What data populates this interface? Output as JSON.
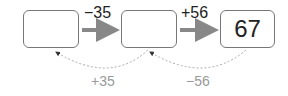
{
  "boxes": [
    {
      "value": ""
    },
    {
      "value": ""
    },
    {
      "value": "67"
    }
  ],
  "forward_ops": [
    "−35",
    "+56"
  ],
  "inverse_ops": [
    "+35",
    "−56"
  ],
  "colors": {
    "arrow": "#888888",
    "box_border": "#777777",
    "inverse_text": "#999999"
  }
}
